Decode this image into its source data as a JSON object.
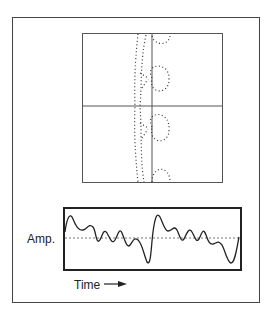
{
  "figure": {
    "top_panel": {
      "description": "Phasor / loop plot with dotted trajectory and crosshair axes"
    },
    "waveform_panel": {
      "ylabel": "Amp.",
      "xlabel": "Time",
      "arrow": "right-arrow"
    }
  },
  "colors": {
    "line": "#333333",
    "background": "#ffffff"
  }
}
